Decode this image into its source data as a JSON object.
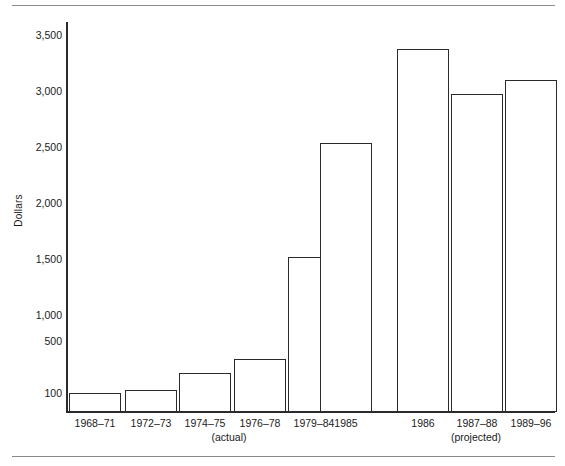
{
  "chart_data": {
    "type": "bar",
    "title": "",
    "subtitle": "",
    "xlabel": "",
    "ylabel": "Dollars",
    "categories": [
      "1968–71",
      "1972–73",
      "1974–75",
      "1976–78",
      "1979–84",
      "1985",
      "1986",
      "1987–88",
      "1989–96"
    ],
    "values": [
      100,
      130,
      290,
      420,
      1400,
      2480,
      3380,
      2950,
      3080
    ],
    "ylim": [
      0,
      3600
    ],
    "ytick_labels": [
      "3,500",
      "3,000",
      "2,500",
      "2,000",
      "1,500",
      "1,000",
      "500",
      "100"
    ],
    "ytick_values": [
      3500,
      3000,
      2500,
      2000,
      1500,
      1000,
      500,
      100
    ],
    "grid": false,
    "legend": "none",
    "group_labels": [
      {
        "label": "(actual)",
        "categories": [
          "1968–71",
          "1972–73",
          "1974–75",
          "1976–78",
          "1979–84",
          "1985"
        ]
      },
      {
        "label": "(projected)",
        "categories": [
          "1986",
          "1987–88",
          "1989–96"
        ]
      }
    ],
    "bar_style": {
      "fill": "#ffffff",
      "stroke": "#2b2b2b"
    },
    "axis_color": "#2b2b2b",
    "rule_color": "#8a8a8a"
  },
  "yticks": {
    "t3500": "3,500",
    "t3000": "3,000",
    "t2500": "2,500",
    "t2000": "2,000",
    "t1500": "1,500",
    "t1000": "1,000",
    "t500": "500",
    "t100": "100"
  },
  "xticks": {
    "c0": "1968–71",
    "c1": "1972–73",
    "c2": "1974–75",
    "c3": "1976–78",
    "c4": "1979–84",
    "c5": "1985",
    "c6": "1986",
    "c7": "1987–88",
    "c8": "1989–96"
  },
  "groups": {
    "actual": "(actual)",
    "projected": "(projected)"
  },
  "axis": {
    "ylabel": "Dollars"
  }
}
